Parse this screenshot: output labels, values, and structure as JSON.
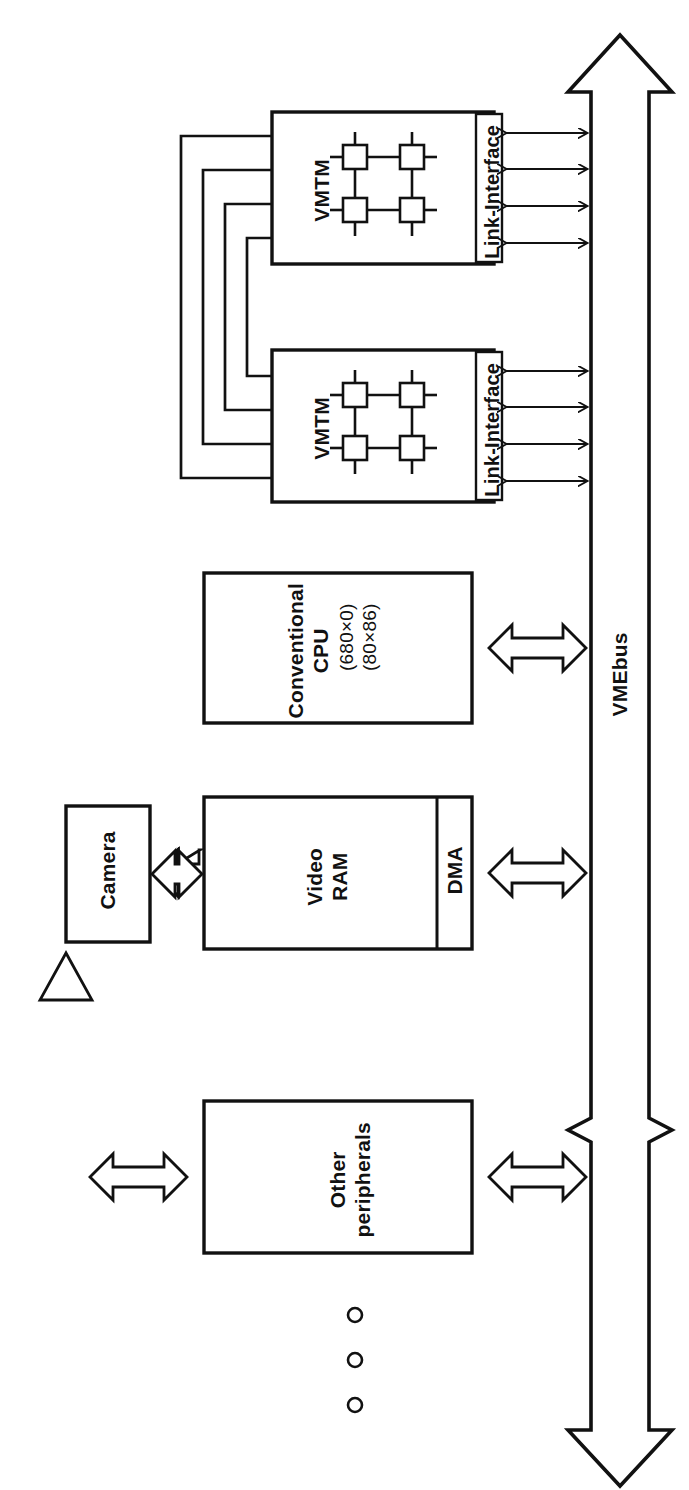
{
  "figure": {
    "kind": "system-block-diagram",
    "orientation": "rotated-90-ccw",
    "background": "#ffffff",
    "stroke": "#111111"
  },
  "blocks": {
    "vmtm_top": {
      "label": "VMTM",
      "interface_label": "Link-Interface",
      "node_count": 4
    },
    "vmtm_bottom": {
      "label": "VMTM",
      "interface_label": "Link-Interface",
      "node_count": 4
    },
    "cpu": {
      "label": "Conventional\nCPU",
      "sub1": "(680×0)",
      "sub2": "(80×86)"
    },
    "video_ram": {
      "label": "Video\nRAM"
    },
    "dma": {
      "label": "DMA"
    },
    "camera": {
      "label": "Camera"
    },
    "other": {
      "label": "Other\nperipherals"
    }
  },
  "bus": {
    "label": "VMEbus",
    "style": "double-headed-block-arrow",
    "has_break": true
  },
  "connections": {
    "link_arrow_count": 8,
    "inter_vmtm_link_count": 4,
    "bus_connector_count": 4,
    "bus_connector_style": "hollow-double-arrow"
  },
  "ellipsis": {
    "dot_count": 3,
    "meaning": "more peripherals"
  },
  "caption": {
    "text": ""
  }
}
